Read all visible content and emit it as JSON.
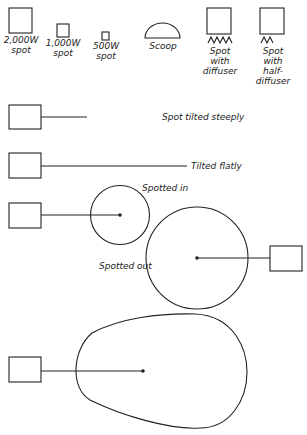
{
  "legend": {
    "spot_2000": [
      "2,000W",
      "spot"
    ],
    "spot_1000": [
      "1,000W",
      "spot"
    ],
    "spot_500": [
      "500W",
      "spot"
    ],
    "scoop": "Scoop",
    "diffuser": [
      "Spot",
      "with",
      "diffuser"
    ],
    "half_diffuser": [
      "Spot",
      "with",
      "half-",
      "diffuser"
    ]
  },
  "examples": {
    "tilted_steeply": "Spot tilted steeply",
    "tilted_flatly": "Tilted flatly",
    "spotted_in": "Spotted in",
    "spotted_out": "Spotted out"
  },
  "colors": {
    "stroke": "#222222",
    "background": "#ffffff"
  }
}
